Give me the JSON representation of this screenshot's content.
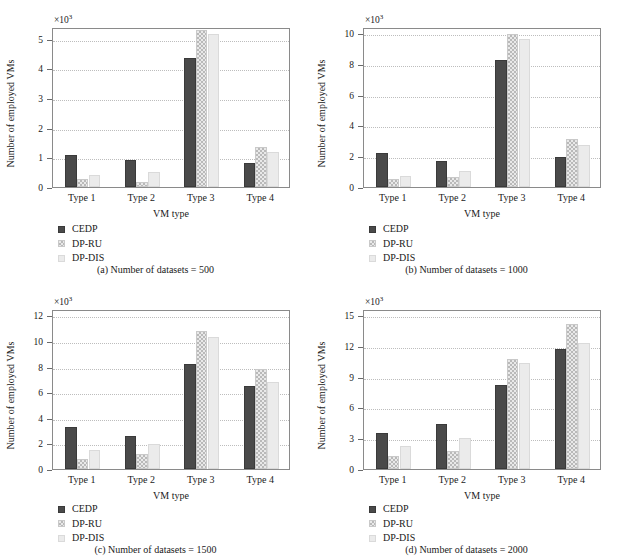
{
  "figure": {
    "series_names": [
      "CEDP",
      "DP-RU",
      "DP-DIS"
    ],
    "colors": {
      "cedp": "#4a4a4a",
      "dpru": "#d8d8d8",
      "dpdis": "#ebebeb"
    }
  },
  "chart_data": [
    {
      "type": "bar",
      "id": "a",
      "caption": "(a)  Number of datasets = 500",
      "title": "",
      "xlabel": "VM type",
      "ylabel": "Number of employed VMs",
      "exponent": "×10",
      "exponent_power": "3",
      "categories": [
        "Type 1",
        "Type 2",
        "Type 3",
        "Type 4"
      ],
      "series": [
        {
          "name": "CEDP",
          "values": [
            1.08,
            0.92,
            4.35,
            0.8
          ]
        },
        {
          "name": "DP-RU",
          "values": [
            0.28,
            0.18,
            5.3,
            1.35
          ]
        },
        {
          "name": "DP-DIS",
          "values": [
            0.4,
            0.5,
            5.15,
            1.17
          ]
        }
      ],
      "ylim": [
        0,
        5.4
      ],
      "yticks": [
        0,
        1,
        2,
        3,
        4,
        5
      ],
      "ytick_labels": [
        "0",
        "1",
        "2",
        "3",
        "4",
        "5"
      ],
      "grid": true,
      "legend_position": "below-left"
    },
    {
      "type": "bar",
      "id": "b",
      "caption": "(b)  Number of datasets = 1000",
      "title": "",
      "xlabel": "VM type",
      "ylabel": "Number of employed VMs",
      "exponent": "×10",
      "exponent_power": "3",
      "categories": [
        "Type 1",
        "Type 2",
        "Type 3",
        "Type 4"
      ],
      "series": [
        {
          "name": "CEDP",
          "values": [
            2.18,
            1.72,
            8.25,
            1.92
          ]
        },
        {
          "name": "DP-RU",
          "values": [
            0.5,
            0.62,
            9.95,
            3.15
          ]
        },
        {
          "name": "DP-DIS",
          "values": [
            0.72,
            1.05,
            9.6,
            2.7
          ]
        }
      ],
      "ylim": [
        0,
        10.4
      ],
      "yticks": [
        0,
        2,
        4,
        6,
        8,
        10
      ],
      "ytick_labels": [
        "0",
        "2",
        "4",
        "6",
        "8",
        "10"
      ],
      "grid": true,
      "legend_position": "below-left"
    },
    {
      "type": "bar",
      "id": "c",
      "caption": "(c)  Number of datasets = 1500",
      "title": "",
      "xlabel": "VM type",
      "ylabel": "Number of employed VMs",
      "exponent": "×10",
      "exponent_power": "3",
      "categories": [
        "Type 1",
        "Type 2",
        "Type 3",
        "Type 4"
      ],
      "series": [
        {
          "name": "CEDP",
          "values": [
            3.3,
            2.55,
            8.2,
            6.5
          ]
        },
        {
          "name": "DP-RU",
          "values": [
            0.8,
            1.18,
            10.8,
            7.8
          ]
        },
        {
          "name": "DP-DIS",
          "values": [
            1.48,
            1.97,
            10.35,
            6.8
          ]
        }
      ],
      "ylim": [
        0,
        12.5
      ],
      "yticks": [
        0,
        2,
        4,
        6,
        8,
        10,
        12
      ],
      "ytick_labels": [
        "0",
        "2",
        "4",
        "6",
        "8",
        "10",
        "12"
      ],
      "grid": true,
      "legend_position": "below-left"
    },
    {
      "type": "bar",
      "id": "d",
      "caption": "(d)  Number of datasets = 2000",
      "title": "",
      "xlabel": "VM type",
      "ylabel": "Number of employed VMs",
      "exponent": "×10",
      "exponent_power": "3",
      "categories": [
        "Type 1",
        "Type 2",
        "Type 3",
        "Type 4"
      ],
      "series": [
        {
          "name": "CEDP",
          "values": [
            3.55,
            4.4,
            8.2,
            11.7
          ]
        },
        {
          "name": "DP-RU",
          "values": [
            1.3,
            1.78,
            10.75,
            14.1
          ]
        },
        {
          "name": "DP-DIS",
          "values": [
            2.2,
            3.05,
            10.35,
            12.3
          ]
        }
      ],
      "ylim": [
        0,
        15.6
      ],
      "yticks": [
        0,
        3,
        6,
        9,
        12,
        15
      ],
      "ytick_labels": [
        "0",
        "3",
        "6",
        "9",
        "12",
        "15"
      ],
      "grid": true,
      "legend_position": "below-left"
    }
  ]
}
